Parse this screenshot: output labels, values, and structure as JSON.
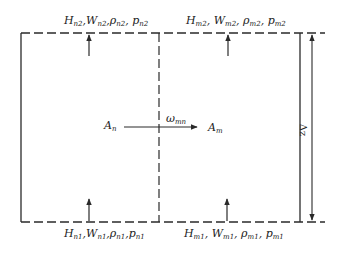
{
  "diagram": {
    "type": "control-volume",
    "labels": {
      "top_left": {
        "parts": [
          [
            "H",
            "n2"
          ],
          [
            "W",
            "n2"
          ],
          [
            "ρ",
            "n2"
          ],
          [
            "p",
            "n2"
          ]
        ]
      },
      "top_right": {
        "parts": [
          [
            "H",
            "m2"
          ],
          [
            "W",
            "m2"
          ],
          [
            "ρ",
            "m2"
          ],
          [
            "p",
            "m2"
          ]
        ]
      },
      "bottom_left": {
        "parts": [
          [
            "H",
            "n1"
          ],
          [
            "W",
            "n1"
          ],
          [
            "ρ",
            "n1"
          ],
          [
            "p",
            "n1"
          ]
        ]
      },
      "bottom_right": {
        "parts": [
          [
            "H",
            "m1"
          ],
          [
            "W",
            "m1"
          ],
          [
            "ρ",
            "m1"
          ],
          [
            "p",
            "m1"
          ]
        ]
      },
      "left_area": {
        "main": "A",
        "sub": "n"
      },
      "right_area": {
        "main": "A",
        "sub": "m"
      },
      "exchange": {
        "main": "ω",
        "sub": "mn"
      },
      "height": "Δz"
    },
    "colors": {
      "line": "#2a2a2a",
      "background": "#ffffff"
    }
  }
}
